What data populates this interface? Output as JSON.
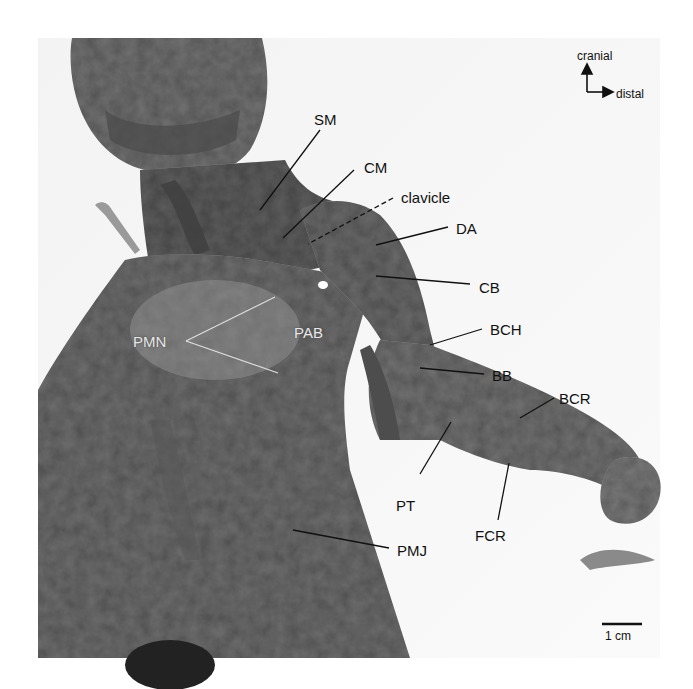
{
  "figure": {
    "type": "anatomical photograph, ventral view of shoulder and forelimb",
    "orientation": {
      "up": "cranial",
      "right": "distal"
    },
    "scale_bar": {
      "label": "1 cm"
    },
    "labels": [
      {
        "id": "SM",
        "text": "SM"
      },
      {
        "id": "CM",
        "text": "CM"
      },
      {
        "id": "clavicle",
        "text": "clavicle"
      },
      {
        "id": "DA",
        "text": "DA"
      },
      {
        "id": "CB",
        "text": "CB"
      },
      {
        "id": "PMN",
        "text": "PMN"
      },
      {
        "id": "PAB",
        "text": "PAB"
      },
      {
        "id": "BCH",
        "text": "BCH"
      },
      {
        "id": "BB",
        "text": "BB"
      },
      {
        "id": "BCR",
        "text": "BCR"
      },
      {
        "id": "PT",
        "text": "PT"
      },
      {
        "id": "FCR",
        "text": "FCR"
      },
      {
        "id": "PMJ",
        "text": "PMJ"
      }
    ]
  },
  "colors": {
    "background": "#ffffff",
    "tissue": "#6b6b6b",
    "tissue_dark": "#4a4a4a",
    "tissue_light": "#8f8f8f",
    "label": "#111111"
  }
}
